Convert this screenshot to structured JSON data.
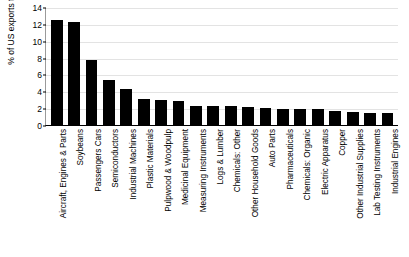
{
  "chart_data": {
    "type": "bar",
    "title": "",
    "xlabel": "",
    "ylabel": "% of US exports to CN",
    "ylim": [
      0,
      14
    ],
    "ytick_step": 2,
    "yticks": [
      0,
      2,
      4,
      6,
      8,
      10,
      12,
      14
    ],
    "grid": true,
    "legend": "none",
    "bar_color": "#000000",
    "grid_color": "#e3e3e3",
    "background": "#ffffff",
    "categories": [
      "Aircraft, Engines & Parts",
      "Soybeans",
      "Passengers Cars",
      "Semiconductors",
      "Industrial Machines",
      "Plastic Materials",
      "Pulpwood & Woodpulp",
      "Medicinal Equipment",
      "Measuring Instruments",
      "Logs & Lumber",
      "Chemicals: Other",
      "Other Household Goods",
      "Auto Parts",
      "Pharmaceuticals",
      "Chemicals: Organic",
      "Electric Apparatus",
      "Copper",
      "Other Industrial Supplies",
      "Lab Testing Instruments",
      "Industrial Engines"
    ],
    "values": [
      12.5,
      12.2,
      7.7,
      5.3,
      4.3,
      3.1,
      3.0,
      2.8,
      2.3,
      2.2,
      2.2,
      2.1,
      2.0,
      1.9,
      1.9,
      1.85,
      1.7,
      1.5,
      1.45,
      1.4
    ]
  }
}
